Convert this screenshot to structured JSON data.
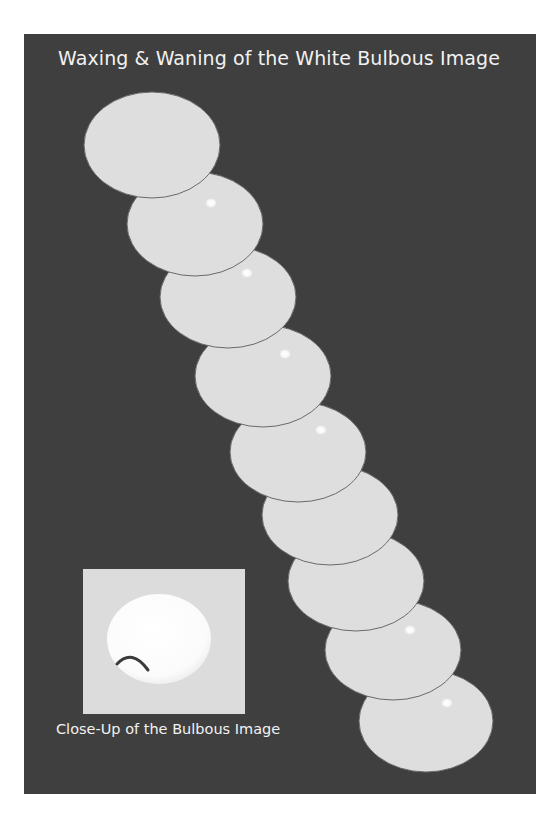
{
  "title": "Waxing & Waning of the White Bulbous Image",
  "caption": "Close-Up of the Bulbous Image",
  "colors": {
    "page_background": "#ffffff",
    "panel_background": "#3f3f3f",
    "ellipse_fill": "#dedede",
    "ellipse_outline": "#6a6a6a",
    "highlight": "#ffffff",
    "inset_background": "#dcdcdc",
    "bulb_fill": "#ffffff",
    "bulb_arc": "#3a3a3a",
    "text": "#f2f2f2"
  },
  "ellipses": [
    {
      "cx": 152,
      "cy": 145,
      "rx": 68,
      "ry": 53,
      "highlight": null
    },
    {
      "cx": 195,
      "cy": 224,
      "rx": 68,
      "ry": 52,
      "highlight": {
        "x": 211,
        "y": 203
      }
    },
    {
      "cx": 228,
      "cy": 297,
      "rx": 68,
      "ry": 51,
      "highlight": {
        "x": 247,
        "y": 273
      }
    },
    {
      "cx": 263,
      "cy": 376,
      "rx": 68,
      "ry": 51,
      "highlight": {
        "x": 285,
        "y": 354
      }
    },
    {
      "cx": 298,
      "cy": 452,
      "rx": 68,
      "ry": 50,
      "highlight": {
        "x": 321,
        "y": 430
      }
    },
    {
      "cx": 330,
      "cy": 515,
      "rx": 68,
      "ry": 50,
      "highlight": null
    },
    {
      "cx": 356,
      "cy": 581,
      "rx": 68,
      "ry": 50,
      "highlight": null
    },
    {
      "cx": 393,
      "cy": 650,
      "rx": 68,
      "ry": 50,
      "highlight": {
        "x": 410,
        "y": 630
      }
    },
    {
      "cx": 426,
      "cy": 721,
      "rx": 67,
      "ry": 51,
      "highlight": {
        "x": 447,
        "y": 703
      }
    }
  ],
  "closeup": {
    "bulb": {
      "cx": 159,
      "cy": 639,
      "rx": 52,
      "ry": 45
    },
    "arc": {
      "x1": 117,
      "y1": 664,
      "cx": 132,
      "cy": 648,
      "x2": 148,
      "y2": 670
    }
  }
}
